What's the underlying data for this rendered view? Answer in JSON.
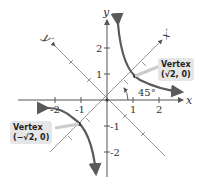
{
  "axes": {
    "x_label": "x",
    "y_label": "y",
    "x_prime_label": "x′",
    "y_prime_label": "y′",
    "x_ticks": [
      "-2",
      "-1",
      "1",
      "2"
    ],
    "y_ticks": [
      "2",
      "1",
      "-1",
      "-2"
    ]
  },
  "angle_label": "45°",
  "vertices": [
    {
      "title": "Vertex",
      "coords": "(√2, 0)"
    },
    {
      "title": "Vertex",
      "coords": "(−√2, 0)"
    }
  ],
  "colors": {
    "axis": "#555555",
    "curve": "#5a5a5a",
    "label_box": "#e6e6e6"
  }
}
